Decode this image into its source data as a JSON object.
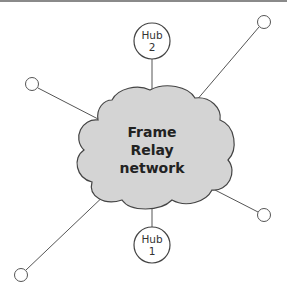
{
  "diagram": {
    "cloud": {
      "lines": [
        "Frame",
        "Relay",
        "network"
      ],
      "fill": "#d4d4d4"
    },
    "hubs": [
      {
        "id": "hub2",
        "line1": "Hub",
        "line2": "2"
      },
      {
        "id": "hub1",
        "line1": "Hub",
        "line2": "1"
      }
    ],
    "endpoints": [
      "top-right",
      "left",
      "right",
      "bottom-left"
    ]
  }
}
